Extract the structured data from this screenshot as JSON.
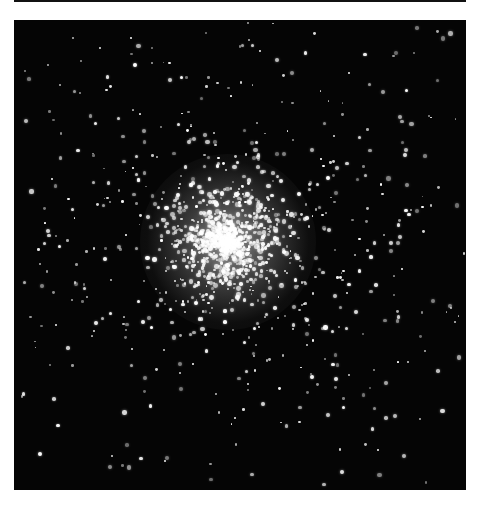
{
  "image": {
    "subject": "Globular star cluster",
    "background_color": "#050505",
    "star_color": "#ffffff",
    "frame": {
      "x": 14,
      "y": 20,
      "width": 452,
      "height": 470
    },
    "core_center": {
      "x": 228,
      "y": 242
    },
    "core_radius": 55,
    "halo_radius": 200
  }
}
